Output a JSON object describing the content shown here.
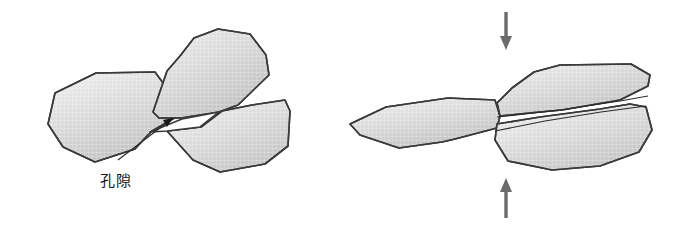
{
  "figure": {
    "background_color": "#ffffff",
    "width": 686,
    "height": 230,
    "outline_color": "#3a3a3a",
    "grain_fill_light": "#eeeeee",
    "grain_fill_dark": "#bdbdbd",
    "void_fill": "#ffffff",
    "load_arrow_color": "#6b6b6b",
    "leader_color": "#1a1a1a"
  },
  "labels": {
    "pore_callout": "孔隙"
  },
  "panels": [
    {
      "id": "left-panel",
      "name": "uncompressed-state",
      "grain_count": 3,
      "has_void": true,
      "has_load_arrows": false
    },
    {
      "id": "right-panel",
      "name": "compressed-state",
      "grain_count": 3,
      "has_void": false,
      "has_load_arrows": true
    }
  ],
  "shapes": {
    "left_grain_west": "M 48,124 L 55,93 L 96,73 L 155,72 L 180,106 L 178,116 L 152,131 L 146,137 L 135,149 L 95,162 L 63,147 Z",
    "left_grain_north": "M 167,71 L 180,56 L 194,38 L 218,29 L 250,34 L 266,55 L 269,75 L 238,105 L 219,112 L 181,118 L 159,118 L 153,112 Z",
    "left_grain_east": "M 222,111 L 252,105 L 285,100 L 290,111 L 288,146 L 265,164 L 220,172 L 193,160 L 167,131 L 201,127 Z",
    "left_void": "M 150,132 L 182,119 L 219,112 L 200,127 L 167,131 Z",
    "left_leader_line": "M 118,160 L 173,118",
    "left_leader_head": "M 173,118 L 163,120 L 167,127 Z",
    "right_grain_west": "M 350,124 L 386,107 L 448,98 L 495,100 L 500,116 L 497,128 L 455,139 L 442,142 L 399,148 L 360,135 Z",
    "right_grain_north": "M 497,103 L 512,88 L 534,72 L 560,65 L 631,64 L 650,75 L 648,86 L 620,100 L 562,110 L 529,113 L 500,116 Z",
    "right_grain_east": "M 497,124 L 540,117 L 600,109 L 630,104 L 646,107 L 652,130 L 639,152 L 600,166 L 552,170 L 508,161 L 495,140 Z",
    "right_seam_upper": "M 497,117 L 560,110 L 620,101 L 648,96",
    "right_seam_lower": "M 495,131 L 545,121 L 601,112 L 646,106",
    "arrow_down": {
      "shaft": "M 506,12 L 506,38",
      "head": "M 506,50 L 500,36 L 512,36 Z"
    },
    "arrow_up": {
      "shaft": "M 506,218 L 506,192 ",
      "head": "M 506,178 L 500,192 L 512,192 Z"
    }
  },
  "text_positions": {
    "pore_callout_x": 100,
    "pore_callout_y": 186
  }
}
